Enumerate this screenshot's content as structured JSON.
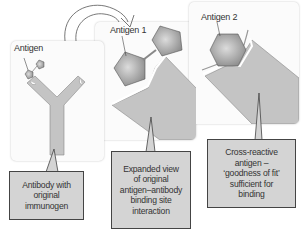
{
  "diagram": {
    "colors": {
      "panel_bg": "#fbfbfb",
      "antibody_fill": "#c4c4c4",
      "antibody_stroke": "#8a8a8a",
      "antigen_fill": "#a8a8a8",
      "callout_fill": "#d4d4d4",
      "callout_border": "#444444"
    },
    "panels": [
      {
        "id": "original",
        "antigen_label": "Antigen",
        "callout": "Antibody with\noriginal\nimmunogen"
      },
      {
        "id": "expanded",
        "antigen_label": "Antigen 1",
        "callout": "Expanded view\nof original\nantigen–antibody\nbinding site\ninteraction"
      },
      {
        "id": "cross-reactive",
        "antigen_label": "Antigen 2",
        "callout": "Cross-reactive\nantigen –\n‘goodness of fit’\nsufficient for\nbinding"
      }
    ],
    "arrow": "curved-arrow"
  }
}
